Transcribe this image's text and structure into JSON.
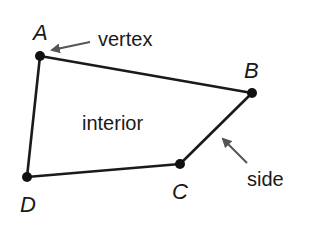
{
  "diagram": {
    "vertices": [
      {
        "name": "A",
        "x": 40,
        "y": 56,
        "lx": 33,
        "ly": 40
      },
      {
        "name": "B",
        "x": 252,
        "y": 93,
        "lx": 244,
        "ly": 78
      },
      {
        "name": "C",
        "x": 180,
        "y": 164,
        "lx": 172,
        "ly": 199
      },
      {
        "name": "D",
        "x": 27,
        "y": 177,
        "lx": 20,
        "ly": 212
      }
    ],
    "labels": {
      "vertex": "vertex",
      "interior": "interior",
      "side": "side"
    },
    "colors": {
      "stroke": "#1a1a1a",
      "arrow": "#4a4a4a",
      "text": "#1a1a1a"
    }
  }
}
